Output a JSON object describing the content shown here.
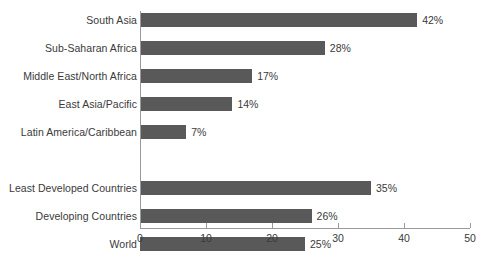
{
  "chart_data": {
    "type": "bar",
    "orientation": "horizontal",
    "title": "",
    "xlabel": "",
    "ylabel": "",
    "xlim": [
      0,
      50
    ],
    "xticks": [
      0,
      10,
      20,
      30,
      40,
      50
    ],
    "grid": false,
    "legend": null,
    "value_suffix": "%",
    "categories": [
      "South Asia",
      "Sub-Saharan Africa",
      "Middle East/North Africa",
      "East Asia/Pacific",
      "Latin America/Caribbean",
      "Least Developed Countries",
      "Developing Countries",
      "World"
    ],
    "values": [
      42,
      28,
      17,
      14,
      7,
      35,
      26,
      25
    ],
    "labels": [
      "42%",
      "28%",
      "17%",
      "14%",
      "7%",
      "35%",
      "26%",
      "25%"
    ],
    "groups": [
      {
        "name": "regions",
        "categories": [
          "South Asia",
          "Sub-Saharan Africa",
          "Middle East/North Africa",
          "East Asia/Pacific",
          "Latin America/Caribbean"
        ]
      },
      {
        "name": "aggregates",
        "categories": [
          "Least Developed Countries",
          "Developing Countries",
          "World"
        ]
      }
    ]
  },
  "style": {
    "bar_color": "#595959",
    "axis_color": "#9a9a9a",
    "text_color": "#3a3a3a",
    "background": "#ffffff"
  }
}
